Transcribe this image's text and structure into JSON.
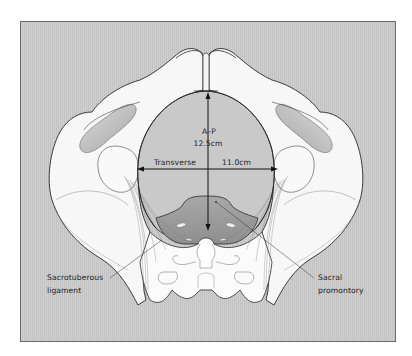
{
  "diagram": {
    "measurements": {
      "ap": {
        "label": "A–P",
        "value": "12.5cm"
      },
      "transverse": {
        "label": "Transverse",
        "value": "11.0cm"
      }
    },
    "annotations": {
      "sacrotuberous": {
        "line1": "Sacrotuberous",
        "line2": "ligament"
      },
      "sacral_promontory": {
        "line1": "Sacral",
        "line2": "promontory"
      }
    },
    "colors": {
      "background_panel": "#c9c9c9",
      "bone": "#f7f7f7",
      "bone_outline": "#2a2a2a",
      "inlet_shadow": "#9a9a9a",
      "arrows": "#111111",
      "text": "#1e1e1e"
    }
  }
}
